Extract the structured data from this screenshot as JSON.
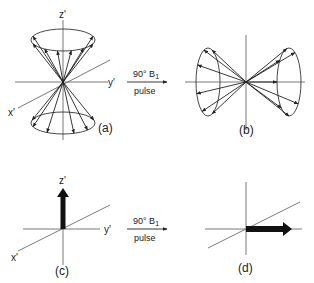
{
  "panels": {
    "a": {
      "label": "(a)",
      "axes": {
        "z": "z'",
        "y": "y'",
        "x": "x'"
      }
    },
    "b": {
      "label": "(b)"
    },
    "c": {
      "label": "(c)",
      "axes": {
        "z": "z'",
        "y": "y'",
        "x": "x'"
      }
    },
    "d": {
      "label": "(d)"
    }
  },
  "transitions": [
    {
      "above": "90° B",
      "subscript": "1",
      "below": "pulse"
    },
    {
      "above": "90° B",
      "subscript": "1",
      "below": "pulse"
    }
  ],
  "colors": {
    "ink": "#222222",
    "axis": "#555555",
    "background": "#ffffff"
  }
}
